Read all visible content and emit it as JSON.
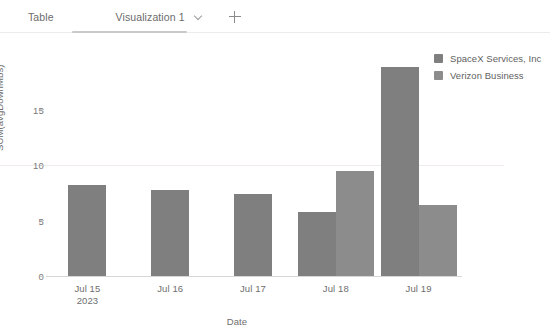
{
  "tabs": {
    "table_label": "Table",
    "visualization_label": "Visualization 1",
    "chevron_icon": "chevron-down-icon",
    "add_icon": "plus-icon",
    "active_tab": "Visualization 1"
  },
  "legend": {
    "position": "top-right",
    "items": [
      {
        "label": "SpaceX Services, Inc",
        "color": "#7f7f7f"
      },
      {
        "label": "Verizon Business",
        "color": "#8c8c8c"
      }
    ]
  },
  "chart_data": {
    "type": "bar",
    "title": "",
    "xlabel": "Date",
    "ylabel": "SUM(avgDownMbs)",
    "categories": [
      "Jul 15\n2023",
      "Jul 16",
      "Jul 17",
      "Jul 18",
      "Jul 19"
    ],
    "category_labels": [
      {
        "line1": "Jul 15",
        "line2": "2023"
      },
      {
        "line1": "Jul 16",
        "line2": ""
      },
      {
        "line1": "Jul 17",
        "line2": ""
      },
      {
        "line1": "Jul 18",
        "line2": ""
      },
      {
        "line1": "Jul 19",
        "line2": ""
      }
    ],
    "series": [
      {
        "name": "SpaceX Services, Inc",
        "color": "#7f7f7f",
        "values": [
          8.2,
          7.8,
          7.4,
          5.8,
          18.9
        ]
      },
      {
        "name": "Verizon Business",
        "color": "#8c8c8c",
        "values": [
          null,
          null,
          null,
          9.5,
          6.4
        ]
      }
    ],
    "ylim": [
      0,
      19.5
    ],
    "yticks": [
      0,
      5,
      10,
      15
    ],
    "ytick_labels": [
      "0",
      "5",
      "10",
      "15"
    ],
    "grid": true,
    "grid_values": [
      10
    ],
    "legend_position": "top-right"
  }
}
